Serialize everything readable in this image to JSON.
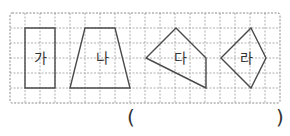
{
  "figure": {
    "grid": {
      "x0": 10,
      "y0": 13,
      "cell": 15,
      "cols": 18,
      "rows": 6,
      "line_color": "#9a9a9a"
    },
    "shapes": [
      {
        "id": "ga",
        "label": "가",
        "type": "rectangle",
        "points": "25,28 55,28 55,88 25,88",
        "label_x": 40,
        "label_y": 63
      },
      {
        "id": "na",
        "label": "나",
        "type": "trapezoid",
        "points": "85,28 115,28 130,88 70,88",
        "label_x": 102,
        "label_y": 63
      },
      {
        "id": "da",
        "label": "다",
        "type": "quadrilateral",
        "points": "176,28 206,58 206,88 146,58",
        "label_x": 180,
        "label_y": 63
      },
      {
        "id": "ra",
        "label": "라",
        "type": "kite",
        "points": "251,28 266,58 251,88 221,58",
        "label_x": 246,
        "label_y": 63
      }
    ],
    "shape_stroke": "#4a4a4a"
  },
  "answer": {
    "open_paren": "(",
    "close_paren": ")",
    "value": ""
  }
}
